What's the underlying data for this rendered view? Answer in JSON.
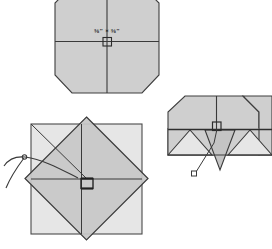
{
  "figure": {
    "background_color": "#ffffff",
    "width": 272,
    "height": 249,
    "line_color": "#3a3a3a",
    "line_color_dark": "#2b2b2b",
    "fill_light": "#e4e4e4",
    "fill_mid": "#cfcfcf",
    "fill_dark": "#c2c2c2"
  },
  "panels": {
    "top": {
      "name": "octagon-top-view",
      "dimension_label": "⅜\" × ⅜\"",
      "dimension_numerator_a": "3",
      "dimension_denominator_a": "8",
      "dimension_numerator_b": "3",
      "dimension_denominator_b": "8",
      "multiply_symbol": "×",
      "unit_mark": "\"",
      "center_marker": "square-mortise-marker",
      "crosshair_horizontal": "centerline-horizontal",
      "crosshair_vertical": "centerline-vertical"
    },
    "bottom_left": {
      "name": "square-with-diamond-overlay",
      "base_shape": "square",
      "overlay_shape": "rotated-square-diamond",
      "annotation": "curved-leader-arrow",
      "annotation_marker": "pivot-point-circle",
      "notch_detail": "center-notch-detail"
    },
    "right": {
      "name": "folded-flaps-view",
      "base_shape": "octagon-top-half",
      "flap_shape": "triangular-flaps",
      "center_marker": "square-mortise-marker",
      "leader_line": "callout-leader-line",
      "leader_target": "small-square-callout"
    }
  }
}
